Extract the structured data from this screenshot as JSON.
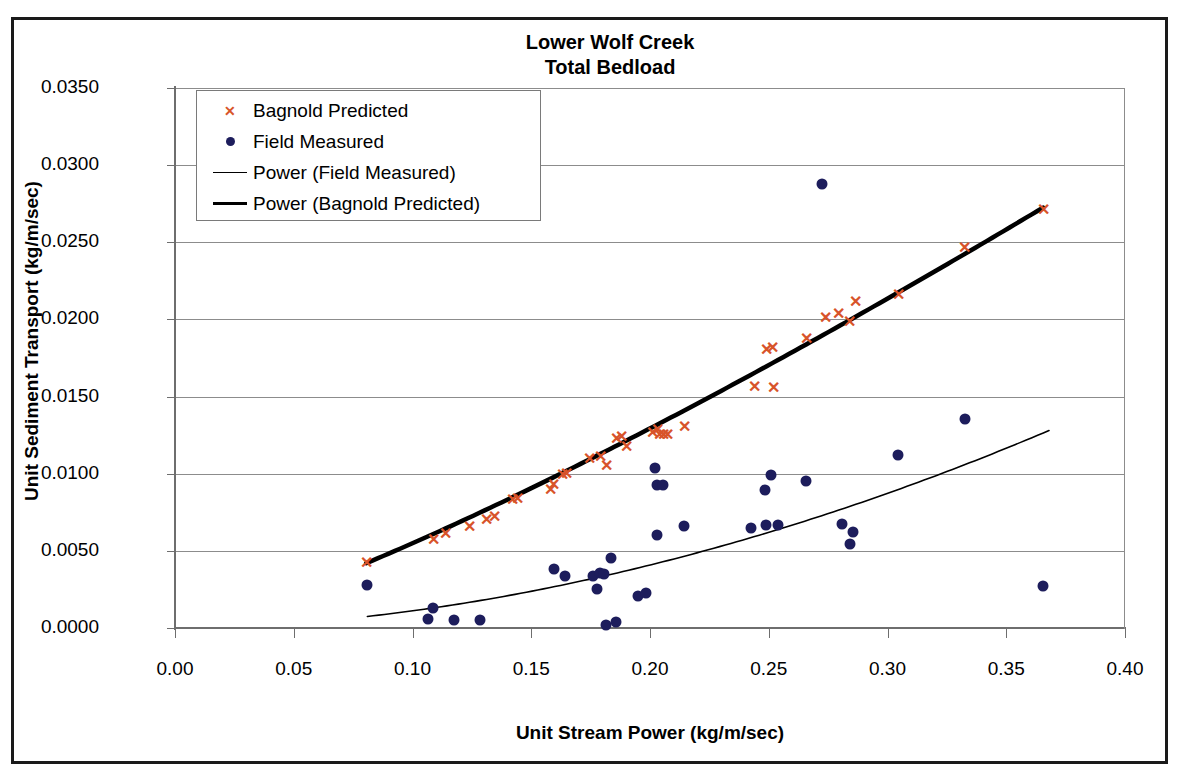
{
  "chart_data": {
    "type": "scatter",
    "title": "Lower Wolf Creek\nTotal Bedload",
    "title_line1": "Lower Wolf Creek",
    "title_line2": "Total Bedload",
    "xlabel": "Unit Stream Power (kg/m/sec)",
    "ylabel": "Unit Sediment Transport (kg/m/sec)",
    "xlim": [
      0.0,
      0.4
    ],
    "ylim": [
      0.0,
      0.035
    ],
    "xticks": [
      "0.00",
      "0.05",
      "0.10",
      "0.15",
      "0.20",
      "0.25",
      "0.30",
      "0.35",
      "0.40"
    ],
    "xtick_values": [
      0.0,
      0.05,
      0.1,
      0.15,
      0.2,
      0.25,
      0.3,
      0.35,
      0.4
    ],
    "yticks": [
      "0.0000",
      "0.0050",
      "0.0100",
      "0.0150",
      "0.0200",
      "0.0250",
      "0.0300",
      "0.0350"
    ],
    "ytick_values": [
      0.0,
      0.005,
      0.01,
      0.015,
      0.02,
      0.025,
      0.03,
      0.035
    ],
    "grid": "horizontal",
    "legend_position": "upper-left-inside",
    "colors": {
      "bagnold_marker": "#d8542a",
      "field_marker": "#1d1d5c",
      "trend_field": "#000000",
      "trend_bagnold": "#000000",
      "gridline": "#8c8c8c",
      "frame": "#1a1a1a"
    },
    "series": [
      {
        "name": "Bagnold Predicted",
        "marker": "x",
        "color": "#d8542a",
        "points": [
          [
            0.0805,
            0.0042
          ],
          [
            0.109,
            0.0057
          ],
          [
            0.114,
            0.0061
          ],
          [
            0.124,
            0.00655
          ],
          [
            0.131,
            0.007
          ],
          [
            0.1345,
            0.0072
          ],
          [
            0.142,
            0.0083
          ],
          [
            0.144,
            0.00835
          ],
          [
            0.158,
            0.00895
          ],
          [
            0.1595,
            0.00925
          ],
          [
            0.163,
            0.0099
          ],
          [
            0.165,
            0.01
          ],
          [
            0.1745,
            0.01095
          ],
          [
            0.179,
            0.0111
          ],
          [
            0.1815,
            0.0105
          ],
          [
            0.186,
            0.01225
          ],
          [
            0.188,
            0.0124
          ],
          [
            0.19,
            0.01175
          ],
          [
            0.201,
            0.01265
          ],
          [
            0.203,
            0.01285
          ],
          [
            0.204,
            0.0125
          ],
          [
            0.2055,
            0.0125
          ],
          [
            0.2075,
            0.0125
          ],
          [
            0.2145,
            0.01305
          ],
          [
            0.244,
            0.01565
          ],
          [
            0.249,
            0.018
          ],
          [
            0.2515,
            0.01815
          ],
          [
            0.252,
            0.01555
          ],
          [
            0.266,
            0.0187
          ],
          [
            0.274,
            0.0201
          ],
          [
            0.2795,
            0.02035
          ],
          [
            0.284,
            0.01985
          ],
          [
            0.2865,
            0.0211
          ],
          [
            0.3045,
            0.0216
          ],
          [
            0.3325,
            0.02465
          ],
          [
            0.3655,
            0.0271
          ]
        ]
      },
      {
        "name": "Field Measured",
        "marker": "o",
        "color": "#1d1d5c",
        "points": [
          [
            0.081,
            0.0028
          ],
          [
            0.1065,
            0.0006
          ],
          [
            0.1085,
            0.0013
          ],
          [
            0.1175,
            0.0005
          ],
          [
            0.1285,
            0.0005
          ],
          [
            0.1595,
            0.00385
          ],
          [
            0.164,
            0.0034
          ],
          [
            0.1815,
            0.0002
          ],
          [
            0.176,
            0.0034
          ],
          [
            0.179,
            0.00355
          ],
          [
            0.1805,
            0.0035
          ],
          [
            0.1775,
            0.00255
          ],
          [
            0.1835,
            0.00455
          ],
          [
            0.1855,
            0.0004
          ],
          [
            0.195,
            0.00205
          ],
          [
            0.1985,
            0.00225
          ],
          [
            0.202,
            0.01035
          ],
          [
            0.203,
            0.00925
          ],
          [
            0.2055,
            0.0093
          ],
          [
            0.203,
            0.00605
          ],
          [
            0.2145,
            0.0066
          ],
          [
            0.2425,
            0.0065
          ],
          [
            0.2485,
            0.00895
          ],
          [
            0.251,
            0.0099
          ],
          [
            0.249,
            0.0067
          ],
          [
            0.254,
            0.0067
          ],
          [
            0.2655,
            0.00955
          ],
          [
            0.2725,
            0.0288
          ],
          [
            0.281,
            0.00675
          ],
          [
            0.2855,
            0.0062
          ],
          [
            0.284,
            0.00545
          ],
          [
            0.3045,
            0.0112
          ],
          [
            0.3325,
            0.01355
          ],
          [
            0.3655,
            0.00275
          ]
        ]
      },
      {
        "name": "Power (Field Measured)",
        "type": "trendline",
        "style": "thin",
        "color": "#000000",
        "x_range": [
          0.081,
          0.368
        ],
        "y_range": [
          0.00075,
          0.0128
        ]
      },
      {
        "name": "Power (Bagnold Predicted)",
        "type": "trendline",
        "style": "thick",
        "color": "#000000",
        "x_range": [
          0.0805,
          0.3655
        ],
        "y_range": [
          0.0042,
          0.02725
        ]
      }
    ],
    "legend_entries": [
      {
        "label": "Bagnold Predicted",
        "key": "marker-x",
        "color": "#d8542a"
      },
      {
        "label": "Field Measured",
        "key": "marker-dot",
        "color": "#1d1d5c"
      },
      {
        "label": "Power (Field Measured)",
        "key": "line-thin",
        "color": "#000000"
      },
      {
        "label": "Power (Bagnold Predicted)",
        "key": "line-thick",
        "color": "#000000"
      }
    ]
  }
}
